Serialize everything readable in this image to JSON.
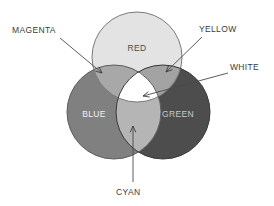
{
  "diagram": {
    "background_color": "#ffffff",
    "circles": [
      {
        "id": "red",
        "label": "RED",
        "fill": "#e3e3e3",
        "stroke": "#7a7a7a",
        "label_color": "#4a4a4a",
        "cx": 137,
        "cy": 57,
        "r": 45,
        "label_x": 137,
        "label_y": 51
      },
      {
        "id": "blue",
        "label": "BLUE",
        "fill": "#808080",
        "stroke": "#5e5e5e",
        "label_color": "#f2f2f2",
        "cx": 114,
        "cy": 112,
        "r": 47,
        "label_x": 94,
        "label_y": 117
      },
      {
        "id": "green",
        "label": "GREEN",
        "fill": "#4d4d4d",
        "stroke": "#3a3a3a",
        "label_color": "#c8c8c8",
        "cx": 163,
        "cy": 112,
        "r": 47,
        "label_x": 178,
        "label_y": 117
      }
    ],
    "overlaps": [
      {
        "id": "magenta",
        "label": "MAGENTA",
        "fill": "#a8a8a8",
        "pair": "red+blue"
      },
      {
        "id": "yellow",
        "label": "YELLOW",
        "fill": "#a3a3a3",
        "pair": "red+green"
      },
      {
        "id": "cyan",
        "label": "CYAN",
        "fill": "#b5b5b5",
        "pair": "blue+green"
      },
      {
        "id": "white",
        "label": "WHITE",
        "fill": "#ffffff",
        "pair": "red+blue+green"
      }
    ],
    "callouts": [
      {
        "id": "magenta",
        "label": "MAGENTA",
        "text_x": 12,
        "text_y": 33,
        "anchor": "start",
        "line_x1": 60,
        "line_y1": 38,
        "line_x2": 102,
        "line_y2": 73,
        "arrow_angle": 40
      },
      {
        "id": "yellow",
        "label": "YELLOW",
        "text_x": 199,
        "text_y": 32,
        "anchor": "start",
        "line_x1": 202,
        "line_y1": 37,
        "line_x2": 166,
        "line_y2": 72,
        "arrow_angle": 136
      },
      {
        "id": "white",
        "label": "WHITE",
        "text_x": 230,
        "text_y": 70,
        "anchor": "start",
        "line_x1": 228,
        "line_y1": 73,
        "line_x2": 143,
        "line_y2": 96,
        "arrow_angle": 165
      },
      {
        "id": "cyan",
        "label": "CYAN",
        "text_x": 116,
        "text_y": 195,
        "anchor": "start",
        "line_x1": 133,
        "line_y1": 182,
        "line_x2": 133,
        "line_y2": 126,
        "arrow_angle": -90
      }
    ]
  }
}
